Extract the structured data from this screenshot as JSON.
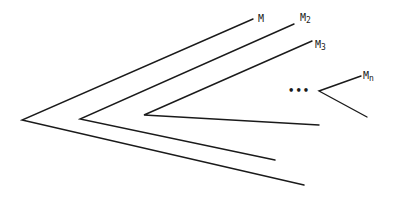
{
  "diagram": {
    "type": "nested chevrons (angles)",
    "chevrons": [
      {
        "id": "M",
        "label": "M",
        "sub": "",
        "apex": [
          22,
          120
        ],
        "upper": [
          253,
          19
        ],
        "lower": [
          304,
          185
        ]
      },
      {
        "id": "M2",
        "label": "M",
        "sub": "2",
        "apex": [
          80,
          119
        ],
        "upper": [
          294,
          24
        ],
        "lower": [
          275,
          160
        ]
      },
      {
        "id": "M3",
        "label": "M",
        "sub": "3",
        "apex": [
          144,
          115
        ],
        "upper": [
          312,
          41
        ],
        "lower": [
          319,
          125
        ]
      },
      {
        "id": "Mn",
        "label": "M",
        "sub": "n",
        "apex": [
          319,
          91
        ],
        "upper": [
          361,
          76
        ],
        "lower": [
          367,
          117
        ]
      }
    ],
    "ellipsis": "•••",
    "line_color": "#1a1a1a"
  }
}
